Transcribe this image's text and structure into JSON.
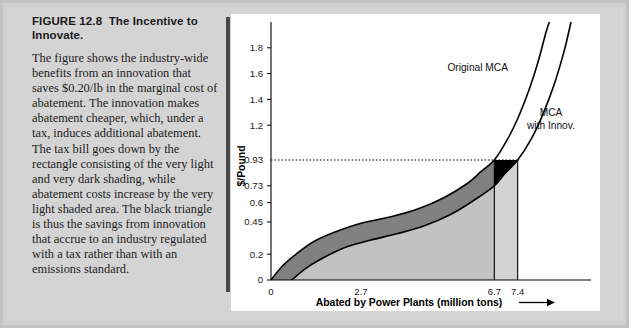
{
  "figure": {
    "number_label": "FIGURE 12.8",
    "title": "The Incentive to Innovate.",
    "caption": "The figure shows the industry-wide benefits from an innovation that saves $0.20/lb in the marginal cost of abatement. The innovation makes abatement cheaper, which, under a tax, induces additional abatement. The tax bill goes down by the rectangle consisting of the very light and very dark shading, while abatement costs increase by the very light shaded area. The black triangle is thus the savings from innovation that accrue to an industry regulated with a tax rather than with an emissions standard."
  },
  "colors": {
    "page_background": "#d4d4d4",
    "panel_background": "#ffffff",
    "divider": "#4a4a4a",
    "dark_band": "#808080",
    "light_fill": "#c2c2c2",
    "very_light_fill": "#d2d2d2",
    "black_triangle": "#000000"
  },
  "chart_data": {
    "type": "line",
    "title": "",
    "xlabel": "Abated by Power Plants (million tons)",
    "ylabel": "$/Pound",
    "xlim": [
      0,
      9.6
    ],
    "ylim": [
      0,
      2.0
    ],
    "grid": false,
    "legend_position": "inline-annotations",
    "x_ticks": [
      0,
      2.7,
      6.7,
      7.4
    ],
    "x_tick_labels": [
      "0",
      "2.7",
      "6.7",
      "7.4"
    ],
    "y_ticks": [
      0,
      0.2,
      0.45,
      0.6,
      0.73,
      0.93,
      1.2,
      1.4,
      1.6,
      1.8
    ],
    "y_tick_labels": [
      "0",
      "0.2",
      "0.45",
      "0.6",
      "0.73",
      "0.93",
      "1.2",
      "1.4",
      "1.6",
      "1.8"
    ],
    "annotations": [
      {
        "name": "original-mca-label",
        "text": "Original MCA",
        "x": 6.2,
        "y": 1.62
      },
      {
        "name": "mca-with-innov-label-line1",
        "text": "MCA",
        "x": 8.4,
        "y": 1.27
      },
      {
        "name": "mca-with-innov-label-line2",
        "text": "with Innov.",
        "x": 8.4,
        "y": 1.17
      }
    ],
    "reference_lines": [
      {
        "name": "tax-level-dotted-line",
        "axis": "y",
        "value": 0.93,
        "style": "dotted"
      },
      {
        "name": "abatement-original-vline",
        "axis": "x",
        "value": 6.7,
        "style": "solid"
      },
      {
        "name": "abatement-innovation-vline",
        "axis": "x",
        "value": 7.4,
        "style": "solid"
      }
    ],
    "series": [
      {
        "name": "Original MCA",
        "points": [
          [
            0.0,
            0.0
          ],
          [
            0.35,
            0.11
          ],
          [
            0.8,
            0.21
          ],
          [
            1.3,
            0.3
          ],
          [
            1.9,
            0.37
          ],
          [
            2.7,
            0.44
          ],
          [
            3.6,
            0.49
          ],
          [
            4.4,
            0.55
          ],
          [
            5.2,
            0.64
          ],
          [
            5.9,
            0.75
          ],
          [
            6.3,
            0.84
          ],
          [
            6.7,
            0.93
          ],
          [
            7.05,
            1.07
          ],
          [
            7.4,
            1.25
          ],
          [
            7.75,
            1.48
          ],
          [
            8.0,
            1.68
          ],
          [
            8.25,
            1.92
          ],
          [
            8.35,
            2.0
          ]
        ]
      },
      {
        "name": "MCA with Innov.",
        "points": [
          [
            0.62,
            0.0
          ],
          [
            1.1,
            0.1
          ],
          [
            1.7,
            0.19
          ],
          [
            2.3,
            0.26
          ],
          [
            3.0,
            0.31
          ],
          [
            3.8,
            0.36
          ],
          [
            4.6,
            0.42
          ],
          [
            5.4,
            0.51
          ],
          [
            6.1,
            0.62
          ],
          [
            6.7,
            0.73
          ],
          [
            7.0,
            0.82
          ],
          [
            7.4,
            0.93
          ],
          [
            7.8,
            1.09
          ],
          [
            8.15,
            1.28
          ],
          [
            8.5,
            1.52
          ],
          [
            8.8,
            1.78
          ],
          [
            9.0,
            2.0
          ]
        ]
      }
    ],
    "shaded_regions": [
      {
        "name": "dark-band-between-curves",
        "color": "#808080",
        "description": "area between Original MCA and MCA with Innov. curves"
      },
      {
        "name": "light-abatement-cost-area",
        "color": "#c2c2c2",
        "description": "area under MCA with Innov. curve from 0 to 6.7"
      },
      {
        "name": "very-light-added-abatement",
        "color": "#d2d2d2",
        "description": "area between 6.7 and 7.4 under tax level 0.93"
      },
      {
        "name": "black-savings-triangle",
        "color": "#000000",
        "description": "triangle bounded by tax line 0.93, Original MCA and MCA with Innov. between 6.7 and 7.4"
      }
    ]
  }
}
